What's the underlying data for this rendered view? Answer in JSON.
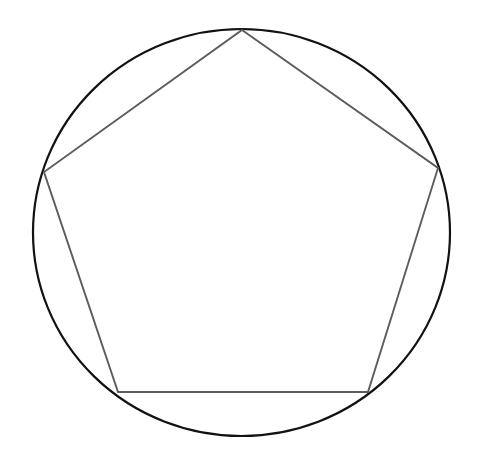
{
  "figure": {
    "background_color": "#ffffff",
    "width": 481,
    "height": 465,
    "labels": [],
    "annotations": []
  },
  "chart_data": {
    "type": "scatter",
    "subtitle": "",
    "xlabel": "",
    "ylabel": "",
    "xlim": [
      0,
      481
    ],
    "ylim": [
      0,
      465
    ],
    "grid": false,
    "legend_position": "none",
    "tick_labels_x": [],
    "tick_labels_y": [],
    "shapes": [
      {
        "name": "circumscribed-circle",
        "kind": "ellipse",
        "cx": 241.5,
        "cy": 232.5,
        "rx": 208.5,
        "ry": 203.5,
        "stroke": "#121212",
        "stroke_width": 2.2,
        "fill": "none"
      },
      {
        "name": "inscribed-pentagon",
        "kind": "polygon",
        "stroke": "#5c5c5c",
        "stroke_width": 1.9,
        "fill": "none",
        "vertex_count": 5,
        "points": "242,30 438,168 368,392 118,392 44,172",
        "vertices": [
          {
            "name": "vertex-top",
            "x": 242,
            "y": 30
          },
          {
            "name": "vertex-right",
            "x": 438,
            "y": 168
          },
          {
            "name": "vertex-bottom-right",
            "x": 368,
            "y": 392
          },
          {
            "name": "vertex-bottom-left",
            "x": 118,
            "y": 392
          },
          {
            "name": "vertex-left",
            "x": 44,
            "y": 172
          }
        ],
        "edges": [
          {
            "name": "edge-top-left",
            "from": "vertex-top",
            "to": "vertex-left"
          },
          {
            "name": "edge-top-right",
            "from": "vertex-top",
            "to": "vertex-right"
          },
          {
            "name": "edge-right-lower",
            "from": "vertex-right",
            "to": "vertex-bottom-right"
          },
          {
            "name": "edge-bottom",
            "from": "vertex-bottom-right",
            "to": "vertex-bottom-left"
          },
          {
            "name": "edge-left-lower",
            "from": "vertex-bottom-left",
            "to": "vertex-left"
          }
        ]
      }
    ],
    "colors": {
      "circle_stroke": "#121212",
      "polygon_stroke": "#5c5c5c",
      "background": "#ffffff"
    }
  }
}
